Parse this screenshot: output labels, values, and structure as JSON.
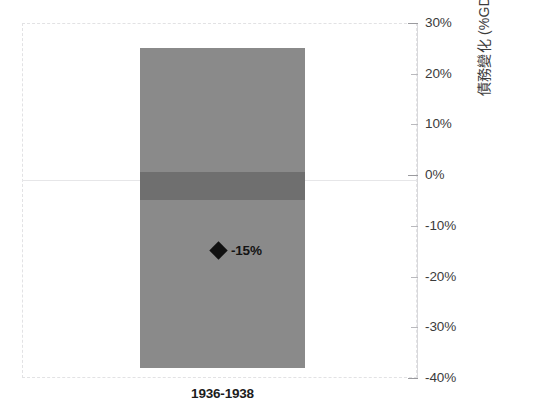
{
  "chart_data": {
    "type": "bar",
    "title": "",
    "subtitle": "",
    "xlabel": "",
    "ylabel": "債務變化 (%GDP，年度)",
    "categories": [
      "1936-1938"
    ],
    "ylim": [
      -40,
      30
    ],
    "y_ticks": [
      30,
      20,
      10,
      0,
      -10,
      -20,
      -30,
      -40
    ],
    "y_tick_labels": [
      "30%",
      "20%",
      "10%",
      "0%",
      "-10%",
      "-20%",
      "-30%",
      "-40%"
    ],
    "grid": "zero-line-only",
    "legend": "none",
    "series": [
      {
        "name": "範圍",
        "type": "range-bar",
        "top": 25,
        "bottom": -38,
        "color": "#8a8a8a"
      },
      {
        "name": "內帶",
        "type": "range-band",
        "top": 0.7,
        "bottom": -5,
        "color": "#6f6f6f"
      },
      {
        "name": "標記",
        "type": "marker",
        "marker": "diamond",
        "value": -15,
        "label": "-15%",
        "color": "#111111"
      }
    ],
    "annotations": [
      {
        "text": "-15%",
        "value": -15,
        "marker": "diamond"
      }
    ]
  },
  "axis": {
    "y_title": "債務變化 (%GDP，年度)",
    "ticks": [
      {
        "label": "30%",
        "value": 30
      },
      {
        "label": "20%",
        "value": 20
      },
      {
        "label": "10%",
        "value": 10
      },
      {
        "label": "0%",
        "value": 0
      },
      {
        "label": "-10%",
        "value": -10
      },
      {
        "label": "-20%",
        "value": -20
      },
      {
        "label": "-30%",
        "value": -30
      },
      {
        "label": "-40%",
        "value": -40
      }
    ],
    "category_label": "1936-1938"
  },
  "marker": {
    "label": "-15%",
    "icon": "diamond-marker-icon"
  },
  "colors": {
    "bar": "#8a8a8a",
    "band": "#6f6f6f",
    "marker": "#111111",
    "gridline": "#e6e6e8",
    "frame": "#e2e2e4",
    "text": "#3b3b3b",
    "background": "#ffffff"
  }
}
